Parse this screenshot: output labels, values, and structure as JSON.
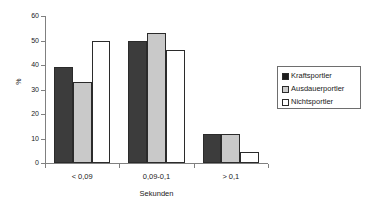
{
  "chart_data": {
    "type": "bar",
    "title": "",
    "subtitle": "",
    "xlabel": "Sekunden",
    "ylabel": "%",
    "categories": [
      "< 0,09",
      "0,09-0,1",
      "> 0,1"
    ],
    "series": [
      {
        "name": "Kraftsportler",
        "values": [
          39,
          50,
          12
        ],
        "color": "#3c3c3c"
      },
      {
        "name": "Ausdauerportler",
        "values": [
          33,
          53,
          12
        ],
        "color": "#c9c9c9"
      },
      {
        "name": "Nichtsportler",
        "values": [
          50,
          46,
          4.5
        ],
        "color": "#ffffff"
      }
    ],
    "ylim": [
      0,
      60
    ],
    "yticks": [
      0,
      10,
      20,
      30,
      40,
      50,
      60
    ],
    "ytick_labels": [
      "0",
      "10",
      "20",
      "30",
      "40",
      "50",
      "60"
    ],
    "grid": false,
    "legend_position": "right"
  },
  "legend": {
    "entries": [
      {
        "label": "Kraftsportler"
      },
      {
        "label": "Ausdauerportler"
      },
      {
        "label": "Nichtsportler"
      }
    ]
  }
}
